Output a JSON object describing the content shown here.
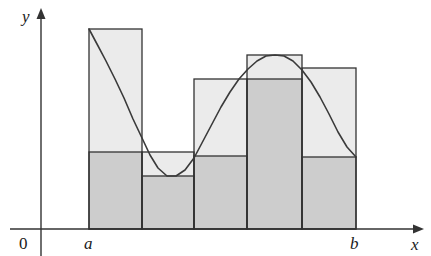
{
  "figure": {
    "kind": "riemann-sum-diagram",
    "title": "",
    "background_color": "#ffffff",
    "stroke_color": "#333333",
    "upper_fill_color": "#ebebeb",
    "lower_fill_color": "#cdcdcd",
    "curve_color": "#3a3a3a"
  },
  "axes": {
    "origin_label": "0",
    "x_label": "x",
    "y_label": "y",
    "x_axis_y_px": 229,
    "y_axis_x_px": 41,
    "x_axis_arrow_tip_px": 424,
    "y_axis_arrow_tip_px": 8,
    "tick_labels": [
      {
        "text": "a",
        "x_px": 89
      },
      {
        "text": "b",
        "x_px": 356
      }
    ]
  },
  "chart_data": {
    "type": "bar",
    "title": "",
    "xlabel": "x",
    "ylabel": "y",
    "grid": false,
    "legend": null,
    "interval": {
      "a_label": "a",
      "b_label": "b",
      "a_px": 89,
      "b_px": 356
    },
    "baseline_px": 229,
    "partition_edges_px": [
      89,
      142,
      194,
      247,
      302,
      356
    ],
    "categories": [
      "1",
      "2",
      "3",
      "4",
      "5"
    ],
    "series": [
      {
        "name": "upper-sum-rectangles",
        "values_px_top": [
          29,
          152,
          79,
          55,
          68
        ]
      },
      {
        "name": "lower-sum-rectangles",
        "values_px_top": [
          152,
          176,
          156,
          79,
          157
        ]
      }
    ],
    "curve": {
      "name": "f(x)",
      "points_px": [
        [
          89,
          29
        ],
        [
          97,
          44
        ],
        [
          106,
          61
        ],
        [
          115,
          79
        ],
        [
          124,
          98
        ],
        [
          133,
          119
        ],
        [
          142,
          138
        ],
        [
          150,
          155
        ],
        [
          158,
          168
        ],
        [
          167,
          176
        ],
        [
          176,
          176
        ],
        [
          185,
          170
        ],
        [
          194,
          158
        ],
        [
          203,
          141
        ],
        [
          212,
          124
        ],
        [
          221,
          107
        ],
        [
          230,
          92
        ],
        [
          239,
          79
        ],
        [
          248,
          69
        ],
        [
          257,
          61
        ],
        [
          266,
          56
        ],
        [
          275,
          55
        ],
        [
          284,
          56
        ],
        [
          293,
          61
        ],
        [
          302,
          70
        ],
        [
          311,
          82
        ],
        [
          320,
          97
        ],
        [
          329,
          114
        ],
        [
          338,
          132
        ],
        [
          347,
          147
        ],
        [
          356,
          157
        ]
      ]
    }
  }
}
